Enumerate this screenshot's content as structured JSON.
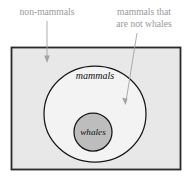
{
  "figure": {
    "kind": "euler-diagram",
    "background_color": "#ffffff"
  },
  "universe_box": {
    "name": "universe-rectangle",
    "fill_color": "#e8e8e8",
    "stroke_color": "#2a2a2a",
    "x": 11.5,
    "y": 47.5,
    "width": 169,
    "height": 122
  },
  "sets": [
    {
      "id": "mammals",
      "label": "mammals",
      "shape": "ellipse",
      "cx": 95,
      "cy": 114,
      "rx": 51,
      "ry": 48,
      "fill_color": "#f3f3f3",
      "stroke_color": "#171717",
      "label_x": 95,
      "label_y": 79
    },
    {
      "id": "whales",
      "label": "whales",
      "shape": "circle",
      "cx": 93,
      "cy": 132,
      "rx": 19,
      "ry": 19,
      "fill_color": "#bdbdbd",
      "stroke_color": "#171717",
      "label_x": 93,
      "label_y": 135
    }
  ],
  "annotations": [
    {
      "id": "non-mammals",
      "lines": [
        "non-mammals"
      ],
      "text_color": "#9a9a9a",
      "text_anchor": "middle",
      "text_x": 47,
      "text_y": 15,
      "arrow": {
        "x1": 47,
        "y1": 21,
        "x2": 47,
        "y2": 62,
        "color": "#a3a3a3"
      }
    },
    {
      "id": "mammals-that-are-not-whales",
      "lines": [
        "mammals that",
        "are not whales"
      ],
      "text_color": "#9a9a9a",
      "text_anchor": "middle",
      "text_x": 144,
      "text_y": 15,
      "arrow": {
        "x1": 137,
        "y1": 33,
        "x2": 125.5,
        "y2": 104,
        "color": "#a3a3a3"
      }
    }
  ]
}
